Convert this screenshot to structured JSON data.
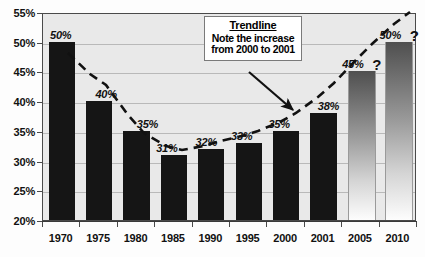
{
  "chart_data": {
    "type": "bar",
    "title": "",
    "xlabel": "",
    "ylabel": "",
    "ylim": [
      20,
      55
    ],
    "ytick_step": 5,
    "grid": true,
    "legend": "none",
    "categories": [
      "1970",
      "1975",
      "1980",
      "1985",
      "1990",
      "1995",
      "2000",
      "2001",
      "2005",
      "2010"
    ],
    "values": [
      50,
      40,
      35,
      31,
      32,
      33,
      35,
      38,
      45,
      50
    ],
    "value_labels": [
      "50%",
      "40%",
      "35%",
      "31%",
      "32%",
      "33%",
      "35%",
      "38%",
      "45%",
      "50%"
    ],
    "ytick_labels": [
      "55%",
      "50%",
      "45%",
      "40%",
      "35%",
      "30%",
      "25%",
      "20%"
    ],
    "ytick_values": [
      55,
      50,
      45,
      40,
      35,
      30,
      25,
      20
    ],
    "bar_styles": [
      "solid",
      "solid",
      "solid",
      "solid",
      "solid",
      "solid",
      "solid",
      "solid",
      "fade",
      "fade"
    ],
    "projected_markers": [
      {
        "category": "2005",
        "marker": "?"
      },
      {
        "category": "2010",
        "marker": "?"
      }
    ],
    "annotations": [
      {
        "name": "trendline-callout",
        "title": "Trendline",
        "lines": [
          "Note the increase",
          "from 2000 to 2001"
        ]
      }
    ],
    "series_overlay": {
      "name": "Trendline",
      "style": "dashed",
      "color": "#111111"
    },
    "colors": {
      "bar_actual": "#151515",
      "bar_projected_top": "#4f4f4f",
      "bar_projected_bottom": "#fdfdfd",
      "plot_background": "#e9e9e9",
      "gridline": "#b9b9b9",
      "frame": "#4a4a4a",
      "text": "#111111"
    }
  }
}
